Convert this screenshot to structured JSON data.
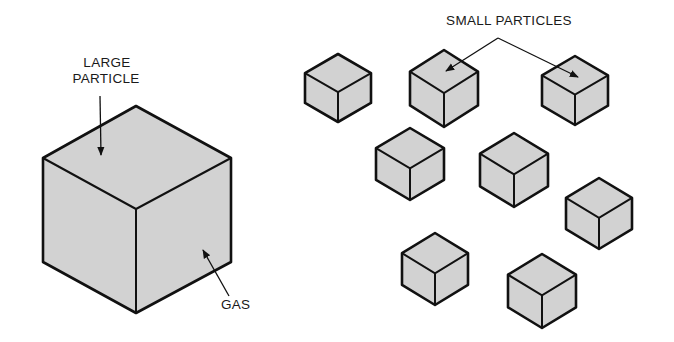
{
  "labels": {
    "large_particle_line1": "LARGE",
    "large_particle_line2": "PARTICLE",
    "gas": "GAS",
    "small_particles": "SMALL PARTICLES"
  },
  "colors": {
    "cube_fill": "#d2d2d2",
    "outline": "#111111",
    "background": "#ffffff"
  },
  "large_cube": {
    "top": [
      136,
      106
    ],
    "left": 43,
    "right": 231,
    "mid_y_top": 158,
    "center_y": 209,
    "mid_y_bottom": 262,
    "bottom": 313
  },
  "small_cubes": [
    {
      "cx": 338,
      "top": 54,
      "half_w": 33,
      "bottom": 122
    },
    {
      "cx": 444,
      "top": 50,
      "half_w": 34,
      "bottom": 127
    },
    {
      "cx": 575,
      "top": 56,
      "half_w": 33,
      "bottom": 125
    },
    {
      "cx": 410,
      "top": 128,
      "half_w": 34,
      "bottom": 200
    },
    {
      "cx": 514,
      "top": 133,
      "half_w": 34,
      "bottom": 207
    },
    {
      "cx": 599,
      "top": 178,
      "half_w": 33,
      "bottom": 249
    },
    {
      "cx": 435,
      "top": 233,
      "half_w": 33,
      "bottom": 305
    },
    {
      "cx": 542,
      "top": 254,
      "half_w": 34,
      "bottom": 328
    }
  ]
}
